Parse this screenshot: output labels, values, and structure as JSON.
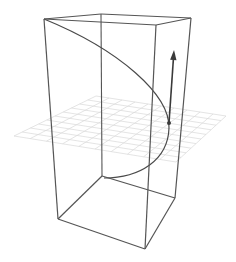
{
  "diagram": {
    "colors": {
      "background": "#ffffff",
      "box_edge": "#555555",
      "curve": "#4a4a4a",
      "arrow": "#3a3a3a",
      "grid": "#d8d8d8"
    },
    "box": {
      "top": {
        "left": [
          44,
          19
        ],
        "back": [
          101,
          14
        ],
        "right": [
          191,
          18
        ],
        "front": [
          156,
          25
        ]
      },
      "bottom": {
        "left": [
          58,
          219
        ],
        "back": [
          102,
          176
        ],
        "right": [
          175,
          198
        ],
        "front": [
          145,
          249
        ]
      }
    },
    "grid_plane": {
      "corners": [
        [
          14,
          136
        ],
        [
          96,
          96
        ],
        [
          226,
          116
        ],
        [
          176,
          162
        ]
      ],
      "divisions": 10
    },
    "curve": {
      "points": "M44,19 C120,50 170,95 169,128 C168,160 140,178 104,178"
    },
    "arrow": {
      "from": [
        169,
        123
      ],
      "to": [
        174,
        50
      ]
    }
  }
}
